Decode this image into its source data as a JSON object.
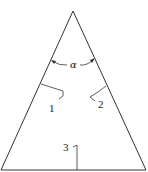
{
  "diagram": {
    "type": "triangle-with-angle-and-markers",
    "stroke_color": "#333333",
    "background": "#ffffff",
    "angle_label": "α",
    "markers": [
      {
        "label": "1",
        "position": "left-side"
      },
      {
        "label": "2",
        "position": "right-side"
      },
      {
        "label": "3",
        "position": "base"
      }
    ]
  }
}
